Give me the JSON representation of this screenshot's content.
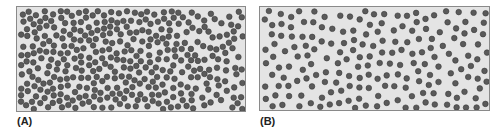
{
  "figure": {
    "panels": [
      {
        "id": "A",
        "label": "(A)",
        "description": "Concentrated particles on the left diffusing toward the right (concentration gradient)",
        "distribution": "gradient-left-to-right",
        "particle_count": 360,
        "seed": 7
      },
      {
        "id": "B",
        "label": "(B)",
        "description": "Particles evenly distributed throughout (equilibrium)",
        "distribution": "uniform",
        "particle_count": 330,
        "seed": 13
      }
    ],
    "colors": {
      "background": "#e4e4e4",
      "border": "#8a8a8a",
      "particle_fill": "#5a5a5a",
      "particle_stroke": "#3a3a3a",
      "label": "#222222"
    }
  }
}
